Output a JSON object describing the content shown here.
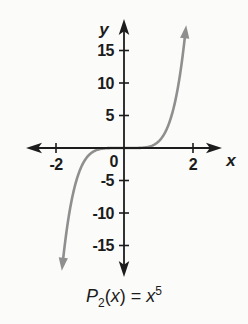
{
  "page": {
    "background": "#fbfbf9"
  },
  "chart_data": {
    "type": "line",
    "title": "",
    "caption": "P2(x) = x^5",
    "function": "y = x^5",
    "xlabel": "x",
    "ylabel": "y",
    "origin_label": "0",
    "x_ticks": [
      "-2",
      "2"
    ],
    "y_ticks": [
      "15",
      "10",
      "5",
      "-5",
      "-10",
      "-15"
    ],
    "xlim": [
      -2.8,
      2.9
    ],
    "ylim": [
      -19,
      19
    ],
    "grid": false,
    "legend": false,
    "axis_color": "#1c1c1c",
    "series": [
      {
        "name": "P2(x) = x^5",
        "color": "#8f8f8f",
        "x": [
          -1.8,
          -1.5,
          -1.2,
          -1.0,
          -0.5,
          0,
          0.5,
          1.0,
          1.2,
          1.5,
          1.8
        ],
        "y": [
          -18.9,
          -7.59,
          -2.49,
          -1.0,
          -0.03,
          0,
          0.03,
          1.0,
          2.49,
          7.59,
          18.9
        ]
      }
    ]
  },
  "labels": {
    "y_axis": "y",
    "x_axis": "x",
    "origin": "0",
    "x_tick_neg2": "-2",
    "x_tick_pos2": "2",
    "y_tick_15": "15",
    "y_tick_10": "10",
    "y_tick_5": "5",
    "y_tick_m5": "-5",
    "y_tick_m10": "-10",
    "y_tick_m15": "-15"
  },
  "caption": {
    "func_name": "P",
    "func_sub": "2",
    "lparen": "(",
    "arg": "x",
    "rparen": ")",
    "equals": " = ",
    "base": "x",
    "exponent": "5"
  }
}
